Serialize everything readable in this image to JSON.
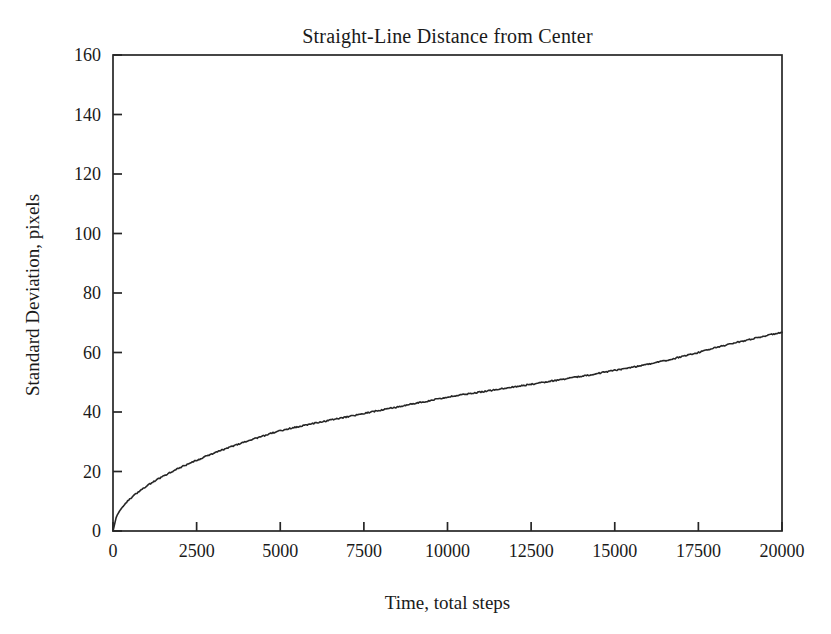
{
  "chart_data": {
    "type": "line",
    "title": "Straight-Line Distance from Center",
    "xlabel": "Time, total steps",
    "ylabel": "Standard Deviation, pixels",
    "xlim": [
      0,
      20000
    ],
    "ylim": [
      0,
      160
    ],
    "xticks": [
      0,
      2500,
      5000,
      7500,
      10000,
      12500,
      15000,
      17500,
      20000
    ],
    "yticks": [
      0,
      20,
      40,
      60,
      80,
      100,
      120,
      140,
      160
    ],
    "xtick_labels": [
      "0",
      "2500",
      "5000",
      "7500",
      "10000",
      "12500",
      "15000",
      "17500",
      "20000"
    ],
    "ytick_labels": [
      "0",
      "20",
      "40",
      "60",
      "80",
      "100",
      "120",
      "140",
      "160"
    ],
    "grid": false,
    "legend": null,
    "frame": "box",
    "tick_direction": "in",
    "line_color": "#262626",
    "line_width": 1.6,
    "background_color": "#ffffff",
    "series": [
      {
        "name": "Straight-line distance standard deviation",
        "x": [
          0,
          100,
          200,
          300,
          400,
          500,
          600,
          700,
          800,
          900,
          1000,
          1200,
          1400,
          1600,
          1800,
          2000,
          2200,
          2400,
          2600,
          2800,
          3000,
          3250,
          3500,
          3750,
          4000,
          4250,
          4500,
          4750,
          5000,
          5500,
          6000,
          6500,
          7000,
          7500,
          8000,
          8500,
          9000,
          9500,
          10000,
          10500,
          11000,
          11500,
          12000,
          12500,
          13000,
          13500,
          14000,
          14500,
          15000,
          15500,
          16000,
          16500,
          17000,
          17500,
          18000,
          18500,
          19000,
          19500,
          20000
        ],
        "y": [
          0.0,
          4.8,
          6.8,
          8.3,
          9.6,
          10.7,
          11.7,
          12.6,
          13.5,
          14.3,
          15.1,
          16.5,
          17.8,
          19.0,
          20.2,
          21.3,
          22.3,
          23.3,
          24.2,
          25.2,
          26.1,
          27.2,
          28.2,
          29.2,
          30.2,
          31.1,
          32.0,
          32.9,
          33.7,
          35.0,
          36.2,
          37.3,
          38.4,
          39.5,
          40.6,
          41.7,
          42.8,
          43.9,
          45.0,
          45.9,
          46.7,
          47.6,
          48.5,
          49.3,
          50.2,
          51.1,
          52.0,
          53.0,
          54.0,
          55.0,
          56.1,
          57.2,
          58.6,
          60.0,
          61.6,
          63.0,
          64.3,
          65.6,
          66.8
        ]
      }
    ]
  }
}
